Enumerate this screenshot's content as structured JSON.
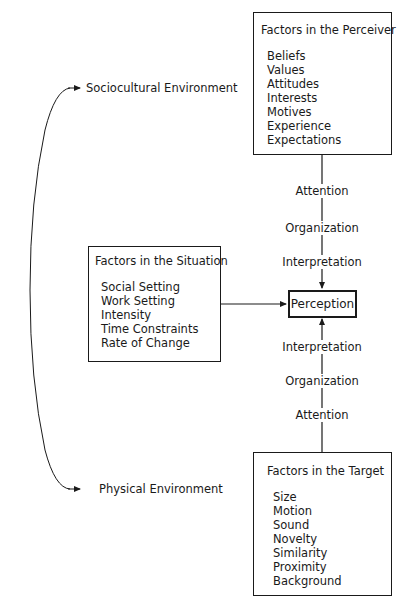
{
  "perceiver": {
    "title": "Factors in the Perceiver",
    "items": [
      "Beliefs",
      "Values",
      "Attitudes",
      "Interests",
      "Motives",
      "Experience",
      "Expectations"
    ]
  },
  "situation": {
    "title": "Factors in the Situation",
    "items": [
      "Social Setting",
      "Work Setting",
      "Intensity",
      "Time Constraints",
      "Rate of Change"
    ]
  },
  "target": {
    "title": "Factors in the Target",
    "items": [
      "Size",
      "Motion",
      "Sound",
      "Novelty",
      "Similarity",
      "Proximity",
      "Background"
    ]
  },
  "center": {
    "label": "Perception"
  },
  "upper_path": [
    "Attention",
    "Organization",
    "Interpretation"
  ],
  "lower_path": [
    "Interpretation",
    "Organization",
    "Attention"
  ],
  "environments": {
    "top": "Sociocultural Environment",
    "bottom": "Physical Environment"
  }
}
